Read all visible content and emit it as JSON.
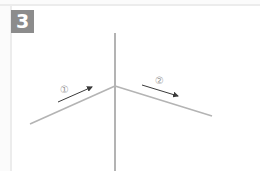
{
  "step": {
    "number": "3"
  },
  "labels": {
    "arrow_1": "①",
    "arrow_2": "②"
  },
  "colors": {
    "badge": "#8c8c8c",
    "fold_line": "#b4b4b4",
    "center_line": "#8a8a8a",
    "arrow": "#3a3a3a"
  }
}
